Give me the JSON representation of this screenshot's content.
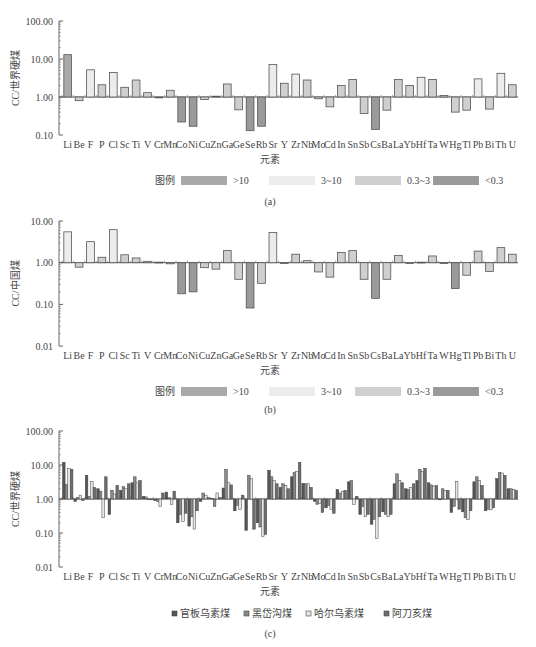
{
  "chart_data": [
    {
      "id": "a",
      "type": "bar",
      "scale": "log",
      "baseline": 1,
      "title": "",
      "caption": "(a)",
      "xlabel": "元素",
      "ylabel": "CC/世界硬煤",
      "ylim": [
        0.1,
        100
      ],
      "yticks": [
        "100.00",
        "10.00",
        "1.00",
        "0.10"
      ],
      "tick_values": [
        100,
        10,
        1,
        0.1
      ],
      "categories": [
        "Li",
        "Be",
        "F",
        "P",
        "Cl",
        "Sc",
        "Ti",
        "V",
        "Cr",
        "Mn",
        "Co",
        "Ni",
        "Cu",
        "Zn",
        "Ga",
        "Ge",
        "Se",
        "Rb",
        "Sr",
        "Y",
        "Zr",
        "Nb",
        "Mo",
        "Cd",
        "In",
        "Sn",
        "Sb",
        "Cs",
        "Ba",
        "La",
        "Yb",
        "Hf",
        "Ta",
        "W",
        "Hg",
        "Tl",
        "Pb",
        "Bi",
        "Th",
        "U"
      ],
      "values": [
        13,
        0.8,
        5.2,
        2.1,
        4.4,
        1.8,
        2.8,
        1.3,
        0.95,
        1.5,
        0.22,
        0.17,
        0.86,
        1.05,
        2.2,
        0.46,
        0.13,
        0.17,
        7.2,
        2.3,
        4.0,
        2.8,
        0.9,
        0.55,
        2.0,
        2.9,
        0.37,
        0.14,
        0.45,
        2.9,
        2.0,
        3.3,
        2.9,
        1.1,
        0.4,
        0.45,
        3.0,
        0.48,
        4.2,
        2.1
      ],
      "legend_title": "图例",
      "legend": [
        {
          "label": ">10",
          "color": "#a9a9a9"
        },
        {
          "label": "3~10",
          "color": "#ececec"
        },
        {
          "label": "0.3~3",
          "color": "#cfcfcf"
        },
        {
          "label": "<0.3",
          "color": "#9a9a9a"
        }
      ],
      "legend_position": "bottom"
    },
    {
      "id": "b",
      "type": "bar",
      "scale": "log",
      "baseline": 1,
      "title": "",
      "caption": "(b)",
      "xlabel": "元素",
      "ylabel": "CC/中国煤",
      "ylim": [
        0.01,
        10
      ],
      "yticks": [
        "10.00",
        "1.00",
        "0.10",
        "0.01"
      ],
      "tick_values": [
        10,
        1,
        0.1,
        0.01
      ],
      "categories": [
        "Li",
        "Be",
        "F",
        "P",
        "Cl",
        "Sc",
        "Ti",
        "V",
        "Cr",
        "Mn",
        "Co",
        "Ni",
        "Cu",
        "Zn",
        "Ga",
        "Ge",
        "Se",
        "Rb",
        "Sr",
        "Y",
        "Zr",
        "Nb",
        "Mo",
        "Cd",
        "In",
        "Sn",
        "Sb",
        "Cs",
        "Ba",
        "La",
        "Yb",
        "Hf",
        "Ta",
        "W",
        "Hg",
        "Tl",
        "Pb",
        "Bi",
        "Th",
        "U"
      ],
      "values": [
        5.5,
        0.78,
        3.2,
        1.35,
        6.2,
        1.55,
        1.3,
        1.08,
        1.03,
        0.94,
        0.18,
        0.2,
        0.76,
        0.7,
        1.95,
        0.4,
        0.082,
        0.32,
        5.3,
        0.98,
        1.6,
        1.12,
        0.6,
        0.45,
        1.75,
        1.95,
        0.4,
        0.14,
        0.4,
        1.5,
        0.97,
        1.03,
        1.45,
        1.0,
        0.24,
        0.5,
        1.9,
        0.62,
        2.3,
        1.6
      ],
      "legend_title": "图例",
      "legend": [
        {
          "label": ">10",
          "color": "#a9a9a9"
        },
        {
          "label": "3~10",
          "color": "#ececec"
        },
        {
          "label": "0.3~3",
          "color": "#cfcfcf"
        },
        {
          "label": "<0.3",
          "color": "#9a9a9a"
        }
      ],
      "legend_position": "bottom"
    },
    {
      "id": "c",
      "type": "bar",
      "scale": "log",
      "baseline": 1,
      "title": "",
      "caption": "(c)",
      "xlabel": "元素",
      "ylabel": "CC/世界硬煤",
      "ylim": [
        0.01,
        100
      ],
      "yticks": [
        "100.00",
        "10.00",
        "1.00",
        "0.10",
        "0.01"
      ],
      "tick_values": [
        100,
        10,
        1,
        0.1,
        0.01
      ],
      "categories": [
        "Li",
        "Be",
        "F",
        "P",
        "Cl",
        "Sc",
        "Ti",
        "V",
        "Cr",
        "Mn",
        "Co",
        "Ni",
        "Cu",
        "Zn",
        "Ga",
        "Ge",
        "Se",
        "Rb",
        "Sr",
        "Y",
        "Zr",
        "Nb",
        "Mo",
        "Cd",
        "In",
        "Sn",
        "Sb",
        "Cs",
        "Ba",
        "La",
        "Yb",
        "Hf",
        "Ta",
        "W",
        "Hg",
        "Tl",
        "Pb",
        "Bi",
        "Th",
        "U"
      ],
      "series": [
        {
          "name": "官板乌素煤",
          "color": "#555555",
          "values": [
            12,
            0.85,
            5.0,
            2.0,
            0.35,
            1.8,
            3.0,
            1.2,
            0.9,
            1.6,
            0.2,
            0.16,
            0.85,
            1.05,
            2.1,
            0.45,
            0.12,
            0.2,
            7.0,
            2.2,
            4.5,
            2.9,
            0.85,
            0.55,
            1.9,
            3.2,
            0.35,
            0.18,
            0.42,
            2.8,
            2.0,
            3.5,
            3.0,
            1.0,
            0.4,
            0.42,
            3.2,
            0.45,
            4.0,
            2.0
          ]
        },
        {
          "name": "黑岱沟煤",
          "color": "#8a8a8a",
          "values": [
            2.7,
            1.1,
            1.2,
            1.7,
            1.8,
            2.3,
            4.5,
            1.15,
            0.85,
            1.1,
            0.35,
            0.3,
            1.5,
            0.6,
            7.5,
            0.65,
            5.0,
            0.15,
            4.5,
            2.8,
            6.0,
            2.8,
            0.7,
            0.65,
            1.5,
            3.5,
            0.6,
            0.25,
            0.35,
            5.5,
            1.9,
            7.5,
            2.6,
            2.0,
            0.6,
            0.28,
            4.5,
            0.5,
            6.0,
            2.0
          ]
        },
        {
          "name": "哈尔乌素煤",
          "color": "#e6e6e6",
          "values": [
            8.0,
            1.3,
            3.3,
            0.28,
            1.4,
            2.0,
            3.0,
            1.0,
            0.6,
            0.7,
            0.22,
            0.13,
            1.3,
            1.5,
            3.0,
            0.5,
            4.0,
            0.08,
            3.5,
            2.5,
            6.5,
            2.8,
            0.75,
            0.5,
            1.7,
            0.7,
            0.3,
            0.07,
            0.3,
            3.5,
            2.2,
            6.5,
            2.4,
            1.8,
            3.3,
            0.25,
            3.5,
            0.48,
            5.8,
            1.9
          ]
        },
        {
          "name": "阿刀亥煤",
          "color": "#6e6e6e",
          "values": [
            7.5,
            0.9,
            2.2,
            4.5,
            2.5,
            2.8,
            3.5,
            0.95,
            1.5,
            1.7,
            0.38,
            0.45,
            1.1,
            1.1,
            2.6,
            1.3,
            0.13,
            0.09,
            2.8,
            2.0,
            12.0,
            2.2,
            0.4,
            0.38,
            1.8,
            1.2,
            0.35,
            0.3,
            0.35,
            3.0,
            2.8,
            8.0,
            2.5,
            1.8,
            0.5,
            0.45,
            2.5,
            0.55,
            5.0,
            1.8
          ]
        }
      ],
      "legend": [
        {
          "label": "官板乌素煤",
          "color": "#555555"
        },
        {
          "label": "黑岱沟煤",
          "color": "#8a8a8a"
        },
        {
          "label": "哈尔乌素煤",
          "color": "#e6e6e6"
        },
        {
          "label": "阿刀亥煤",
          "color": "#6e6e6e"
        }
      ],
      "legend_position": "bottom"
    }
  ],
  "layout": {
    "panels": [
      {
        "top_value_y": 21,
        "decade_px": 38,
        "axis_x": 59,
        "plot_x0": 62,
        "plot_x1": 518,
        "label_y": 148,
        "xlabel_y": 163,
        "legend_y": 180,
        "caption_y": 205
      },
      {
        "top_value_y": 221,
        "decade_px": 41.7,
        "axis_x": 59,
        "plot_x0": 62,
        "plot_x1": 518,
        "label_y": 359,
        "xlabel_y": 374,
        "legend_y": 391,
        "caption_y": 413
      },
      {
        "top_value_y": 431,
        "decade_px": 34,
        "axis_x": 59,
        "plot_x0": 62,
        "plot_x1": 518,
        "label_y": 580,
        "xlabel_y": 595,
        "legend_y": 615,
        "caption_y": 637
      }
    ]
  }
}
